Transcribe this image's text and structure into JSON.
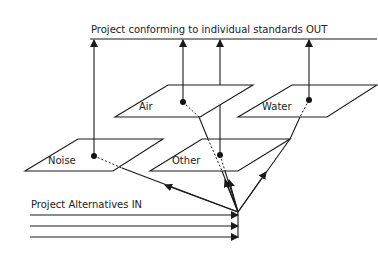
{
  "diagram": {
    "output_label": "Project conforming to individual standards OUT",
    "input_label": "Project Alternatives IN",
    "planes": [
      {
        "id": "air",
        "label": "Air"
      },
      {
        "id": "water",
        "label": "Water"
      },
      {
        "id": "noise",
        "label": "Noise"
      },
      {
        "id": "other",
        "label": "Other"
      }
    ],
    "input_arrows": 3,
    "colors": {
      "line": "#1a1a1a",
      "background": "#ffffff"
    }
  }
}
